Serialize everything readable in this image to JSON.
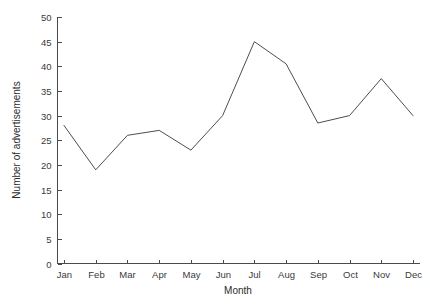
{
  "chart_data": {
    "type": "line",
    "title": "",
    "subtitle": "",
    "xlabel": "Month",
    "ylabel": "Number of advertisements",
    "categories": [
      "Jan",
      "Feb",
      "Mar",
      "Apr",
      "May",
      "Jun",
      "Jul",
      "Aug",
      "Sep",
      "Oct",
      "Nov",
      "Dec"
    ],
    "values": [
      28,
      19,
      26,
      27,
      23,
      30,
      45,
      40.5,
      28.5,
      30,
      37.5,
      30
    ],
    "series": [
      {
        "name": "Number of advertisements",
        "values": [
          28,
          19,
          26,
          27,
          23,
          30,
          45,
          40.5,
          28.5,
          30,
          37.5,
          30
        ]
      }
    ],
    "ylim": [
      0,
      50
    ],
    "yticks": [
      0,
      5,
      10,
      15,
      20,
      25,
      30,
      35,
      40,
      45,
      50
    ],
    "ytick_labels": [
      "0",
      "5",
      "10",
      "15",
      "20",
      "25",
      "30",
      "35",
      "40",
      "45",
      "50"
    ],
    "xtick_labels": [
      "Jan",
      "Feb",
      "Mar",
      "Apr",
      "May",
      "Jun",
      "Jul",
      "Aug",
      "Sep",
      "Oct",
      "Nov",
      "Dec"
    ],
    "grid": false,
    "legend": false,
    "legend_position": "none",
    "markers": false,
    "line_color": "#4d4d4d",
    "background_color": "#ffffff",
    "axis_color": "#4a4a4a"
  }
}
